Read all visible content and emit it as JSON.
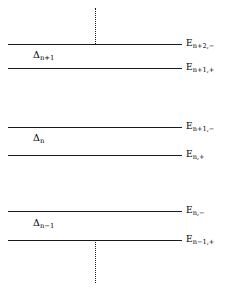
{
  "figure": {
    "background_color": "#ffffff",
    "line_color": "#1a1a1a"
  },
  "levels": [
    {
      "id": "level-1",
      "label_main": "E",
      "label_sub": "n+2,−",
      "y": 44,
      "x_start": 8,
      "x_end": 182
    },
    {
      "id": "level-2",
      "label_main": "E",
      "label_sub": "n+1,+",
      "y": 68,
      "x_start": 8,
      "x_end": 182
    },
    {
      "id": "level-3",
      "label_main": "E",
      "label_sub": "n+1,−",
      "y": 127,
      "x_start": 8,
      "x_end": 182
    },
    {
      "id": "level-4",
      "label_main": "E",
      "label_sub": "n,+",
      "y": 155,
      "x_start": 8,
      "x_end": 182
    },
    {
      "id": "level-5",
      "label_main": "E",
      "label_sub": "n,−",
      "y": 211,
      "x_start": 8,
      "x_end": 182
    },
    {
      "id": "level-6",
      "label_main": "E",
      "label_sub": "n−1,+",
      "y": 240,
      "x_start": 8,
      "x_end": 182
    }
  ],
  "gaps": [
    {
      "id": "gap-1",
      "label_main": "Δ",
      "label_sub": "n+1",
      "x": 33,
      "y": 50
    },
    {
      "id": "gap-2",
      "label_main": "Δ",
      "label_sub": "n",
      "x": 33,
      "y": 133
    },
    {
      "id": "gap-3",
      "label_main": "Δ",
      "label_sub": "n−1",
      "x": 33,
      "y": 218
    }
  ],
  "dotted_lines": [
    {
      "id": "dotted-top",
      "x": 95,
      "y_start": 8,
      "y_end": 44
    },
    {
      "id": "dotted-bottom",
      "x": 95,
      "y_start": 240,
      "y_end": 283
    }
  ]
}
